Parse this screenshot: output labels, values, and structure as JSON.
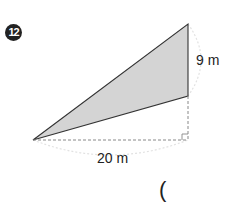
{
  "problem": {
    "number": "12",
    "height_label": "9 m",
    "base_label": "20 m",
    "answer_paren": "("
  },
  "colors": {
    "shaded_fill": "#d4d4d4",
    "line": "#333333",
    "dashed": "#888888",
    "arc": "#e0e0e0"
  }
}
